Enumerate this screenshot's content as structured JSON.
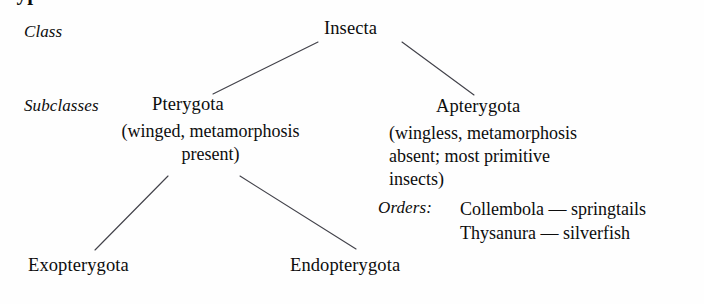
{
  "figure": {
    "title_partial": "Hypothetical classification of the class Insecta",
    "diagram_type": "taxonomic-tree",
    "ink_color": "#0d0d0d",
    "line_color": "#42424a",
    "background_color": "#fefefe"
  },
  "ranks": {
    "class_label": "Class",
    "subclasses_label": "Subclasses",
    "orders_label": "Orders:"
  },
  "nodes": {
    "root": {
      "name": "Insecta"
    },
    "pterygota": {
      "name": "Pterygota",
      "description_lines": [
        "(winged, metamorphosis",
        "present)"
      ]
    },
    "apterygota": {
      "name": "Apterygota",
      "description_lines": [
        "(wingless, metamorphosis",
        "absent; most primitive",
        "insects)"
      ]
    },
    "exopterygota": {
      "name": "Exopterygota"
    },
    "endopterygota": {
      "name": "Endopterygota"
    }
  },
  "orders": [
    "Collembola — springtails",
    "Thysanura — silverfish"
  ],
  "connectors": [
    {
      "name": "insecta-to-pterygota",
      "x1": 318,
      "y1": 42,
      "x2": 213,
      "y2": 94
    },
    {
      "name": "insecta-to-apterygota",
      "x1": 402,
      "y1": 42,
      "x2": 474,
      "y2": 95
    },
    {
      "name": "pterygota-to-exopterygota",
      "x1": 168,
      "y1": 176,
      "x2": 95,
      "y2": 250
    },
    {
      "name": "pterygota-to-endopterygota",
      "x1": 240,
      "y1": 176,
      "x2": 356,
      "y2": 249
    }
  ]
}
